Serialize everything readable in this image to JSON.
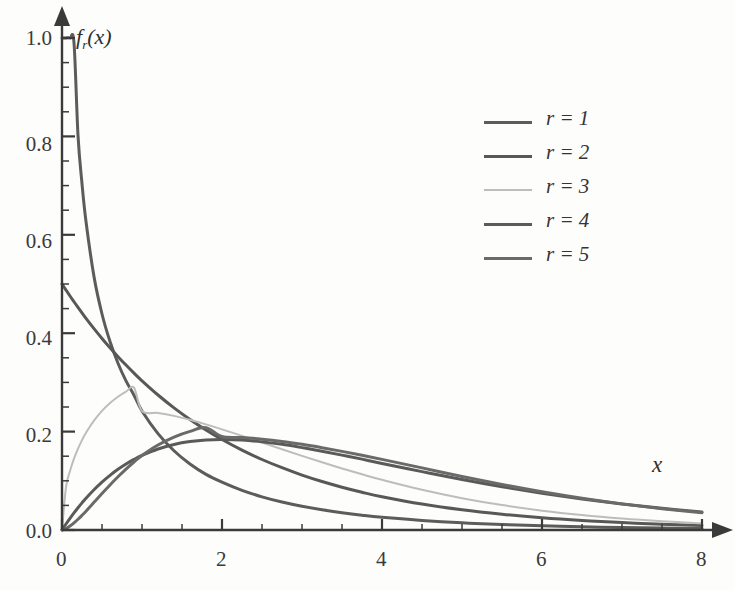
{
  "chart_data": {
    "type": "line",
    "title": "",
    "subtitle": "",
    "xlabel": "x",
    "ylabel": "f_r(x)",
    "ylabel_display": "f",
    "ylabel_sub": "r",
    "ylabel_tail": "(x)",
    "xlim": [
      0,
      8
    ],
    "ylim": [
      0,
      1.0
    ],
    "grid": false,
    "legend_position": "upper right",
    "x_ticks": [
      0,
      2,
      4,
      6,
      8
    ],
    "x_tick_labels": [
      "0",
      "2",
      "4",
      "6",
      "8"
    ],
    "x_minor_step": 0.5,
    "y_ticks": [
      0.0,
      0.2,
      0.4,
      0.6,
      0.8,
      1.0
    ],
    "y_tick_labels": [
      "0.0",
      "0.2",
      "0.4",
      "0.6",
      "0.8",
      "1.0"
    ],
    "y_minor_step": 0.05,
    "annotations": [],
    "x": [
      0.0,
      0.05,
      0.1,
      0.15,
      0.2,
      0.25,
      0.3,
      0.4,
      0.5,
      0.6,
      0.7,
      0.8,
      0.9,
      1.0,
      1.2,
      1.4,
      1.6,
      1.8,
      2.0,
      2.25,
      2.5,
      2.75,
      3.0,
      3.25,
      3.5,
      3.75,
      4.0,
      4.5,
      5.0,
      5.5,
      6.0,
      6.5,
      7.0,
      7.5,
      8.0
    ],
    "series": [
      {
        "name": "r = 1",
        "label": "r = 1",
        "color": "#5c5c5c",
        "width": 3.0,
        "values": [
          1.0,
          1.0,
          1.0,
          0.99,
          0.802,
          0.704,
          0.627,
          0.515,
          0.439,
          0.383,
          0.339,
          0.303,
          0.274,
          0.242,
          0.196,
          0.161,
          0.134,
          0.113,
          0.0972,
          0.0805,
          0.0674,
          0.0568,
          0.0482,
          0.0411,
          0.0352,
          0.0302,
          0.026,
          0.0195,
          0.0146,
          0.0111,
          0.0085,
          0.00652,
          0.00502,
          0.00388,
          0.00301
        ]
      },
      {
        "name": "r = 2",
        "label": "r = 2",
        "color": "#585858",
        "width": 3.0,
        "values": [
          0.5,
          0.4877,
          0.4756,
          0.4639,
          0.4524,
          0.4412,
          0.4303,
          0.4094,
          0.3894,
          0.3704,
          0.3523,
          0.3352,
          0.3188,
          0.3033,
          0.2744,
          0.2483,
          0.2247,
          0.2033,
          0.1839,
          0.1624,
          0.1433,
          0.1266,
          0.1116,
          0.0985,
          0.087,
          0.0768,
          0.0677,
          0.0527,
          0.041,
          0.032,
          0.0249,
          0.0194,
          0.0151,
          0.0118,
          0.00916
        ]
      },
      {
        "name": "r = 3",
        "label": "r = 3",
        "color": "#bdbdbd",
        "width": 2.0,
        "values": [
          0.0,
          0.0869,
          0.12,
          0.145,
          0.1653,
          0.1826,
          0.1976,
          0.2222,
          0.242,
          0.258,
          0.2709,
          0.2812,
          0.2894,
          0.242,
          0.238,
          0.232,
          0.224,
          0.2147,
          0.2046,
          0.1913,
          0.1777,
          0.1641,
          0.1506,
          0.1376,
          0.1251,
          0.1132,
          0.102,
          0.0817,
          0.0646,
          0.0506,
          0.0393,
          0.0303,
          0.0232,
          0.0177,
          0.0134
        ]
      },
      {
        "name": "r = 4",
        "label": "r = 4",
        "color": "#5a5a5a",
        "width": 3.0,
        "values": [
          0.0,
          0.0122,
          0.0238,
          0.0348,
          0.0452,
          0.0551,
          0.0646,
          0.0819,
          0.0974,
          0.1111,
          0.1233,
          0.1341,
          0.1435,
          0.1516,
          0.1646,
          0.1738,
          0.1797,
          0.183,
          0.1839,
          0.1827,
          0.1791,
          0.1741,
          0.1674,
          0.1601,
          0.1522,
          0.144,
          0.1353,
          0.1186,
          0.1026,
          0.0879,
          0.0747,
          0.063,
          0.0528,
          0.0441,
          0.0366
        ]
      },
      {
        "name": "r = 5",
        "label": "r = 5",
        "color": "#6a6a6a",
        "width": 3.0,
        "values": [
          0.0,
          0.0029,
          0.008,
          0.0144,
          0.0218,
          0.0298,
          0.0383,
          0.0562,
          0.0741,
          0.0916,
          0.1082,
          0.1238,
          0.1382,
          0.1516,
          0.1728,
          0.1889,
          0.2005,
          0.2081,
          0.19,
          0.188,
          0.1846,
          0.18,
          0.1741,
          0.1673,
          0.1598,
          0.1519,
          0.1436,
          0.1263,
          0.1088,
          0.0925,
          0.0776,
          0.0645,
          0.0531,
          0.0434,
          0.0352
        ]
      }
    ]
  },
  "axes": {
    "x_arrow": true,
    "y_arrow": true,
    "axis_color": "#3a3a3a"
  }
}
